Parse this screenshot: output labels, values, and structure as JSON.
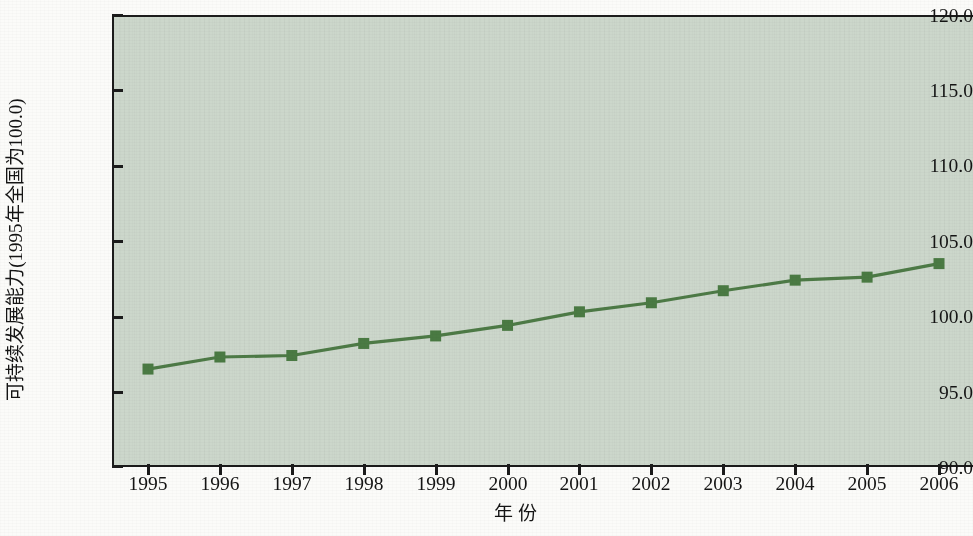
{
  "chart_data": {
    "type": "line",
    "title": "",
    "xlabel": "年  份",
    "ylabel": "可持续发展能力(1995年全国为100.0)",
    "categories": [
      "1995",
      "1996",
      "1997",
      "1998",
      "1999",
      "2000",
      "2001",
      "2002",
      "2003",
      "2004",
      "2005",
      "2006"
    ],
    "x": [
      1995,
      1996,
      1997,
      1998,
      1999,
      2000,
      2001,
      2002,
      2003,
      2004,
      2005,
      2006
    ],
    "values": [
      96.5,
      97.3,
      97.4,
      98.2,
      98.7,
      99.4,
      100.3,
      100.9,
      101.7,
      102.4,
      102.6,
      103.5
    ],
    "series": [
      {
        "name": "可持续发展能力",
        "values": [
          96.5,
          97.3,
          97.4,
          98.2,
          98.7,
          99.4,
          100.3,
          100.9,
          101.7,
          102.4,
          102.6,
          103.5
        ]
      }
    ],
    "ylim": [
      90.0,
      120.0
    ],
    "ytick_labels": [
      "120.0",
      "115.0",
      "110.0",
      "105.0",
      "100.0",
      "95.0",
      "90.0"
    ],
    "yticks": [
      120.0,
      115.0,
      110.0,
      105.0,
      100.0,
      95.0,
      90.0
    ],
    "xlim": [
      1994.5,
      2006.5
    ],
    "grid": false,
    "legend": "none",
    "marker": "square",
    "colors": {
      "line": "#4d7a46",
      "marker": "#4a7a43",
      "plot_background": "#ccd7cb",
      "axis": "#1b1b1b",
      "figure_background": "#fbfbf9",
      "text": "#141414"
    }
  }
}
